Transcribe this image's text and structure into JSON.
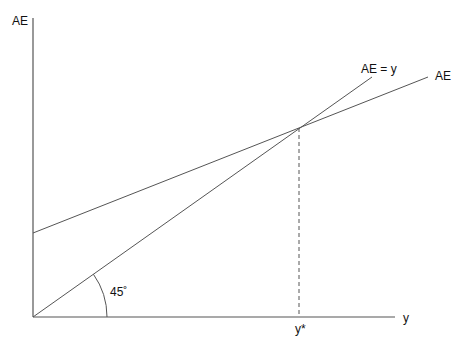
{
  "diagram": {
    "y_axis_label": "AE",
    "x_axis_label": "y",
    "line_45_label": "AE = y",
    "ae_line_label": "AE",
    "angle_label": "45˚",
    "equilibrium_label": "y*",
    "colors": {
      "lines": "#555555",
      "text": "#111111",
      "background": "#ffffff"
    }
  }
}
